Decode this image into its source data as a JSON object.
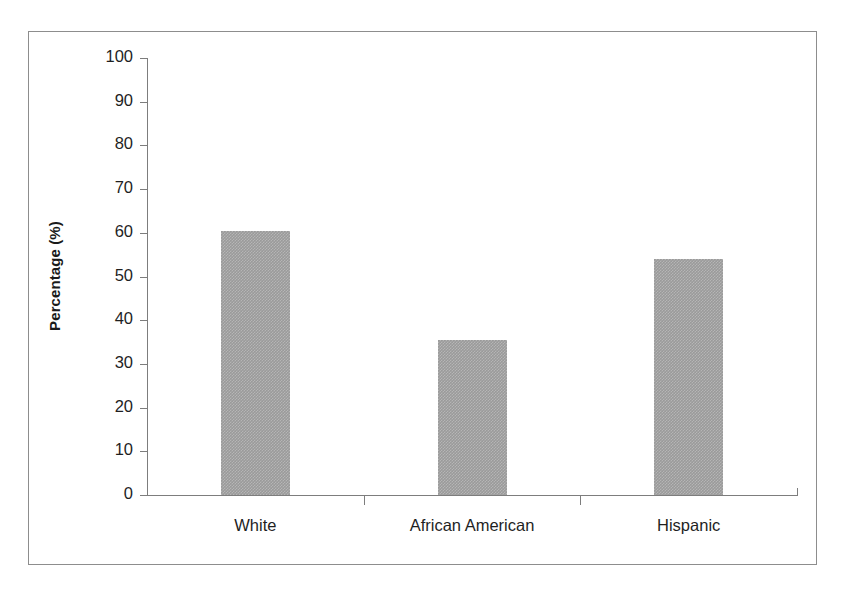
{
  "chart_data": {
    "type": "bar",
    "title": "",
    "xlabel": "",
    "ylabel": "Percentage (%)",
    "categories": [
      "White",
      "African American",
      "Hispanic"
    ],
    "values": [
      60.5,
      35.5,
      54
    ],
    "ylim": [
      0,
      100
    ],
    "yticks": [
      0,
      10,
      20,
      30,
      40,
      50,
      60,
      70,
      80,
      90,
      100
    ],
    "ytick_labels": [
      "0",
      "10",
      "20",
      "30",
      "40",
      "50",
      "60",
      "70",
      "80",
      "90",
      "100"
    ],
    "grid": false,
    "legend": null,
    "bar_color": "#9a9a9a",
    "axis_color": "#7d7d7d",
    "text_color": "#1f1f1f",
    "background": "#ffffff",
    "frame_color": "#8d8d8d"
  }
}
